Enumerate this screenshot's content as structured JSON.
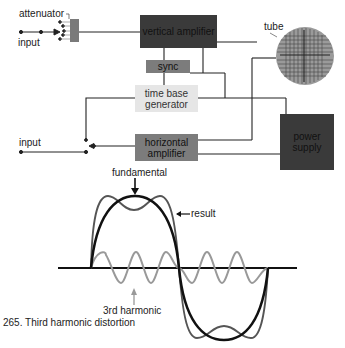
{
  "diagram": {
    "labels": {
      "attenuator": "attenuator",
      "input_top": "input",
      "input_bottom": "input",
      "tube": "tube"
    },
    "blocks": {
      "vertical_amplifier": "vertical amplifier",
      "sync": "sync",
      "time_base_generator": "time base generator",
      "horizontal_amplifier": "horizontal amplifier",
      "power_supply": "power supply"
    },
    "colors": {
      "dark_block": "#3a3a3a",
      "mid_block": "#7c7c7c",
      "light_block": "#e6e6e6",
      "tube_face": "#9a9a9a",
      "line": "#222222"
    }
  },
  "waveform": {
    "labels": {
      "fundamental": "fundamental",
      "result": "result",
      "third_harmonic": "3rd harmonic"
    },
    "colors": {
      "fundamental": "#111111",
      "result": "#555555",
      "third_harmonic": "#999999"
    }
  },
  "caption": "265. Third harmonic distortion"
}
